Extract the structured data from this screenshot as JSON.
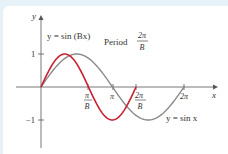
{
  "diagram": {
    "title_label": "y = sin (Bx)",
    "period_label": "Period",
    "period_num": "2π",
    "period_den": "B",
    "sinx_label": "y = sin x",
    "axis_x_label": "x",
    "axis_y_label": "y",
    "y_ticks": [
      "1",
      "−1"
    ],
    "x_ticks": {
      "pi_over_B_num": "π",
      "pi_over_B_den": "B",
      "pi": "π",
      "two_pi_over_B_num": "2π",
      "two_pi_over_B_den": "B",
      "two_pi": "2π"
    },
    "colors": {
      "sin_Bx": "#c8202f",
      "sin_x": "#8a8a8a",
      "axes": "#555555",
      "background": "#e6f1f8"
    }
  }
}
